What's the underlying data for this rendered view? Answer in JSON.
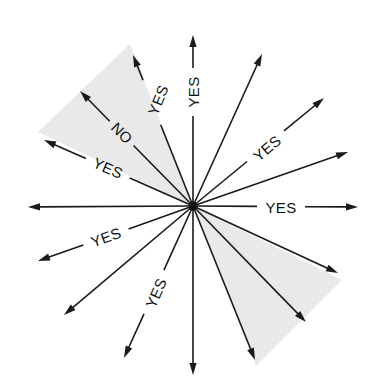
{
  "diagram": {
    "center": {
      "x": 193,
      "y": 206
    },
    "colors": {
      "line": "#1a1a1a",
      "shade": "#e9e9e9",
      "background": "#ffffff"
    },
    "shaded_regions": [
      {
        "name": "upper-left-wedge",
        "points": [
          [
            193,
            206
          ],
          [
            130,
            44
          ],
          [
            38,
            132
          ]
        ]
      },
      {
        "name": "lower-right-wedge",
        "points": [
          [
            193,
            206
          ],
          [
            342,
            280
          ],
          [
            256,
            366
          ]
        ]
      }
    ],
    "rays": [
      {
        "angle": 0,
        "tip": [
          358,
          207
        ],
        "label": "YES",
        "label_pos": [
          281,
          207
        ],
        "label_rot": 0,
        "gap": [
          256,
          313
        ]
      },
      {
        "angle": 19,
        "tip": [
          348,
          152
        ],
        "label": null
      },
      {
        "angle": 40,
        "tip": [
          324,
          98
        ],
        "label": "YES",
        "label_pos": [
          267,
          148
        ],
        "label_rot": -40,
        "gap": [
          240,
          306
        ]
      },
      {
        "angle": 66,
        "tip": [
          262,
          54
        ],
        "label": null
      },
      {
        "angle": 90,
        "tip": [
          193,
          35
        ],
        "label": "YES",
        "label_pos": [
          193,
          92
        ],
        "label_rot": -90,
        "gap": [
          70,
          115
        ]
      },
      {
        "angle": 112,
        "tip": [
          133,
          55
        ],
        "label": "YES",
        "label_pos": [
          158,
          100
        ],
        "label_rot": -68,
        "gap": [
          78,
          124
        ]
      },
      {
        "angle": 135,
        "tip": [
          80,
          91
        ],
        "label": "NO",
        "label_pos": [
          122,
          133
        ],
        "label_rot": 45,
        "gap": [
          108,
          150
        ]
      },
      {
        "angle": 156,
        "tip": [
          44,
          140
        ],
        "label": "YES",
        "label_pos": [
          108,
          168
        ],
        "label_rot": 24,
        "gap": [
          62,
          156
        ]
      },
      {
        "angle": 180,
        "tip": [
          28,
          207
        ],
        "label": null
      },
      {
        "angle": 200,
        "tip": [
          38,
          261
        ],
        "label": "YES",
        "label_pos": [
          106,
          237
        ],
        "label_rot": -20,
        "gap": [
          76,
          137
        ]
      },
      {
        "angle": 220,
        "tip": [
          64,
          315
        ],
        "label": null
      },
      {
        "angle": 246,
        "tip": [
          124,
          358
        ],
        "label": "YES",
        "label_pos": [
          156,
          293
        ],
        "label_rot": -66,
        "gap": [
          262,
          322
        ]
      },
      {
        "angle": 270,
        "tip": [
          193,
          375
        ],
        "label": null
      },
      {
        "angle": 292,
        "tip": [
          255,
          360
        ],
        "label": null
      },
      {
        "angle": 314,
        "tip": [
          306,
          322
        ],
        "label": null
      },
      {
        "angle": 335,
        "tip": [
          338,
          273
        ],
        "label": null
      }
    ],
    "labels": {
      "yes": "YES",
      "no": "NO"
    }
  }
}
